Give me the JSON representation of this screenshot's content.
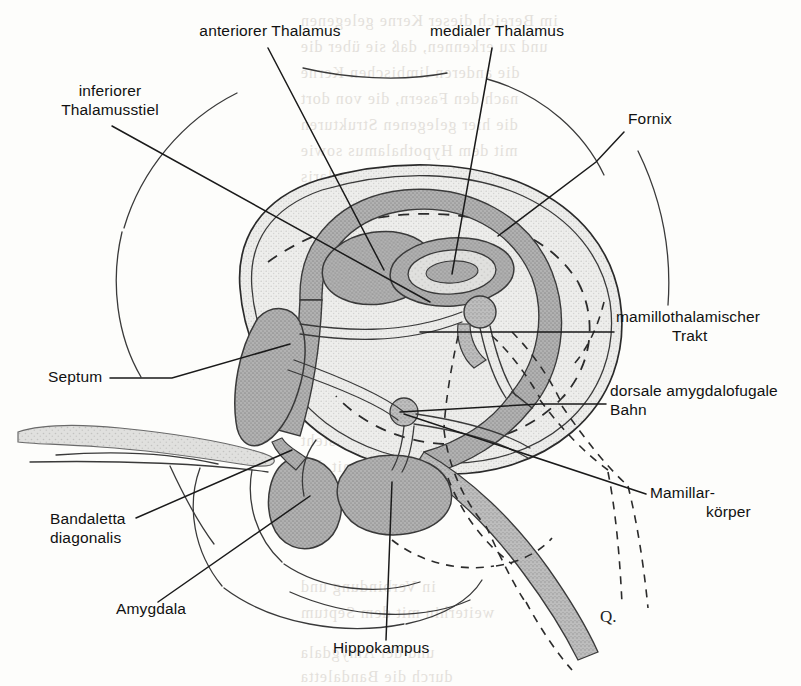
{
  "figure": {
    "signature": "Q."
  },
  "palette": {
    "ink": "#1a1a1a",
    "page": "#fdfdfb",
    "shade_mid": "#a9a9a9",
    "shade_light": "#e4e4e2",
    "shade_tract": "#b5b5b5",
    "shade_pale": "#efefed",
    "bleed_text": "#cfc9c2"
  },
  "labels": [
    {
      "id": "anteriorer-thalamus",
      "text": "anteriorer Thalamus",
      "lines": [
        "anteriorer Thalamus"
      ],
      "x": 270,
      "y": 36,
      "align": "middle"
    },
    {
      "id": "medialer-thalamus",
      "text": "medialer Thalamus",
      "lines": [
        "medialer Thalamus"
      ],
      "x": 497,
      "y": 36,
      "align": "middle"
    },
    {
      "id": "inferiorer-thalamusstiel",
      "text": "inferiorer Thalamusstiel",
      "lines": [
        "inferiorer",
        "Thalamusstiel"
      ],
      "x": 110,
      "y": 96,
      "align": "middle"
    },
    {
      "id": "fornix",
      "text": "Fornix",
      "lines": [
        "Fornix"
      ],
      "x": 628,
      "y": 124,
      "align": "start"
    },
    {
      "id": "mamillothalamischer-trakt",
      "text": "mamillothalamischer Trakt",
      "lines": [
        "mamillothalamischer",
        "Trakt"
      ],
      "x": 616,
      "y": 322,
      "align": "start"
    },
    {
      "id": "septum",
      "text": "Septum",
      "lines": [
        "Septum"
      ],
      "x": 48,
      "y": 382,
      "align": "start"
    },
    {
      "id": "dorsale-amygdalofugale-bahn",
      "text": "dorsale amygdalofugale Bahn",
      "lines": [
        "dorsale amygdalofugale",
        "Bahn"
      ],
      "x": 610,
      "y": 396,
      "align": "start"
    },
    {
      "id": "mamillarkoerper",
      "text": "Mamillarkörper",
      "lines": [
        "Mamillar-",
        "körper"
      ],
      "x": 650,
      "y": 498,
      "align": "start"
    },
    {
      "id": "bandaletta-diagonalis",
      "text": "Bandaletta diagonalis",
      "lines": [
        "Bandaletta",
        "diagonalis"
      ],
      "x": 50,
      "y": 524,
      "align": "start"
    },
    {
      "id": "amygdala",
      "text": "Amygdala",
      "lines": [
        "Amygdala"
      ],
      "x": 116,
      "y": 614,
      "align": "start"
    },
    {
      "id": "hippokampus",
      "text": "Hippokampus",
      "lines": [
        "Hippokampus"
      ],
      "x": 333,
      "y": 653,
      "align": "start"
    }
  ],
  "structures": [
    {
      "id": "cortex-outline",
      "name": "Hirnkontur",
      "fill": "none",
      "stroke": "#2b2b2b"
    },
    {
      "id": "cingulate-lobe",
      "name": "Gyrus cinguli / Hemisphäre",
      "fill": "#e9e9e7",
      "stroke": "#2b2b2b"
    },
    {
      "id": "fornix-arch",
      "name": "Fornix (Bogen)",
      "fill": "#a9a9a9",
      "stroke": "#3a3a3a"
    },
    {
      "id": "thalamus-anterior",
      "name": "anteriorer Thalamuskern",
      "fill": "#a9a9a9",
      "stroke": "#3a3a3a"
    },
    {
      "id": "thalamus-medial",
      "name": "medialer Thalamuskern",
      "fill": "#a9a9a9",
      "stroke": "#3a3a3a"
    },
    {
      "id": "septum-body",
      "name": "Septum",
      "fill": "#9f9f9f",
      "stroke": "#3a3a3a"
    },
    {
      "id": "amygdala-body",
      "name": "Amygdala",
      "fill": "#9f9f9f",
      "stroke": "#3a3a3a"
    },
    {
      "id": "hippocampus-body",
      "name": "Hippokampus",
      "fill": "#a4a4a4",
      "stroke": "#3a3a3a"
    },
    {
      "id": "mamillary-body",
      "name": "Mamillarkörper",
      "fill": "#b5b5b5",
      "stroke": "#3a3a3a"
    },
    {
      "id": "olfactory-tract",
      "name": "Bulbus/Tractus olfactorius",
      "fill": "#d6d6d4",
      "stroke": "#6a6a6a"
    },
    {
      "id": "stria-terminalis",
      "name": "Bandaletta diagonalis",
      "fill": "#b5b5b5",
      "stroke": "#3a3a3a"
    }
  ],
  "bleed_through": [
    {
      "text": "im Bereich dieser Kerne gelegenen",
      "x": 300,
      "y": 12
    },
    {
      "text": "und zu erkennen, daß sie über die",
      "x": 300,
      "y": 38
    },
    {
      "text": "die anderen limbischen Kerne",
      "x": 300,
      "y": 64
    },
    {
      "text": "nach den Fasern, die von dort",
      "x": 300,
      "y": 90
    },
    {
      "text": "die hier gelegenen Strukturen",
      "x": 300,
      "y": 116
    },
    {
      "text": "mit dem Hypothalamus sowie",
      "x": 300,
      "y": 142
    },
    {
      "text": "in der Formatio reticularis",
      "x": 300,
      "y": 168
    },
    {
      "text": "sind die wesentlichen Bahnen",
      "x": 300,
      "y": 194
    },
    {
      "text": "Verbindungen des limbischen",
      "x": 300,
      "y": 220
    },
    {
      "text": "Systems zum Neocortex und",
      "x": 300,
      "y": 246
    },
    {
      "text": "zum Hirnstamm dargestellt",
      "x": 300,
      "y": 272
    },
    {
      "text": "Die Abbildung zeigt ferner",
      "x": 300,
      "y": 298
    },
    {
      "text": "die Verschaltung innerhalb",
      "x": 300,
      "y": 324
    },
    {
      "text": "des limbischen Systems",
      "x": 300,
      "y": 350
    },
    {
      "text": "Der Hippokampus steht",
      "x": 300,
      "y": 432
    },
    {
      "text": "über den Fornix mit den",
      "x": 300,
      "y": 458
    },
    {
      "text": "Corpora mamillaria",
      "x": 300,
      "y": 484
    },
    {
      "text": "in Verbindung und",
      "x": 300,
      "y": 578
    },
    {
      "text": "weiterhin mit dem Septum",
      "x": 300,
      "y": 604
    },
    {
      "text": "und der Amygdala",
      "x": 300,
      "y": 644
    },
    {
      "text": "durch die Bandaletta",
      "x": 300,
      "y": 668
    }
  ]
}
